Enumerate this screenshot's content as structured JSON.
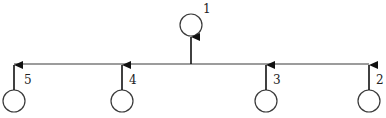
{
  "diagram": {
    "type": "tree",
    "colors": {
      "stroke": "#3a3a3a",
      "background": "#ffffff"
    },
    "root": {
      "id": "1",
      "label": "1",
      "cx": 191,
      "cy": 25,
      "r": 11,
      "lx": 203,
      "ly": 13
    },
    "bus": {
      "x1": 14,
      "x2": 369,
      "y": 64
    },
    "children": [
      {
        "id": "5",
        "label": "5",
        "cx": 14,
        "cy": 101,
        "r": 11,
        "lx": 24,
        "ly": 84
      },
      {
        "id": "4",
        "label": "4",
        "cx": 122,
        "cy": 101,
        "r": 11,
        "lx": 129,
        "ly": 84
      },
      {
        "id": "3",
        "label": "3",
        "cx": 266,
        "cy": 101,
        "r": 11,
        "lx": 273,
        "ly": 84
      },
      {
        "id": "2",
        "label": "2",
        "cx": 369,
        "cy": 101,
        "r": 11,
        "lx": 376,
        "ly": 84
      }
    ],
    "edges": [
      {
        "from": "5",
        "to": "bus"
      },
      {
        "from": "4",
        "to": "bus"
      },
      {
        "from": "3",
        "to": "bus"
      },
      {
        "from": "2",
        "to": "bus"
      },
      {
        "from": "bus",
        "to": "1"
      }
    ]
  }
}
